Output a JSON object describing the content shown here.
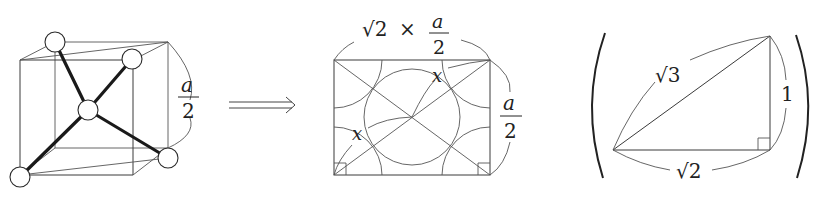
{
  "figure": {
    "panel1": {
      "description": "Diamond-type unit subcube (a/2) with central atom tetrahedrally bonded to four corner atoms",
      "edge_label": {
        "numerator": "a",
        "denominator": "2"
      }
    },
    "arrow": {
      "symbol": "⟹"
    },
    "panel2": {
      "description": "Diagonal cross-section rectangle of the subcube showing atoms as circles",
      "top_label": {
        "sqrt": "√2",
        "times": "×",
        "numerator": "a",
        "denominator": "2"
      },
      "side_label": {
        "numerator": "a",
        "denominator": "2"
      },
      "x_labels": [
        "x",
        "x"
      ]
    },
    "panel3": {
      "description": "Right triangle with sides ratio √2 : 1 : √3",
      "hypotenuse_label": "√3",
      "vertical_label": "1",
      "base_label": "√2"
    }
  }
}
